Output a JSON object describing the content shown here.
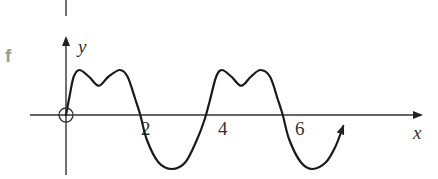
{
  "panel_label": "f",
  "chart_data": {
    "type": "line",
    "title": "",
    "xlabel": "x",
    "ylabel": "y",
    "x_ticks": [
      {
        "value": 2,
        "label": "2"
      },
      {
        "value": 4,
        "label": "4"
      },
      {
        "value": 6,
        "label": "6"
      }
    ],
    "xlim": [
      -1.6,
      7.7
    ],
    "ylim": [
      -1.4,
      1.5
    ],
    "grid": false,
    "annotations": [
      {
        "type": "open-circle",
        "x": 0,
        "y": 0,
        "meaning": "origin / excluded point"
      },
      {
        "type": "arrowhead",
        "at": "curve-end",
        "meaning": "curve continues"
      }
    ],
    "series": [
      {
        "name": "curve",
        "points": [
          [
            0,
            0
          ],
          [
            0.1,
            0.45
          ],
          [
            0.2,
            0.85
          ],
          [
            0.35,
            1.0
          ],
          [
            0.6,
            0.85
          ],
          [
            0.85,
            0.65
          ],
          [
            1.1,
            0.85
          ],
          [
            1.4,
            1.0
          ],
          [
            1.6,
            0.85
          ],
          [
            1.8,
            0.35
          ],
          [
            1.93,
            0.0
          ],
          [
            2.1,
            -0.55
          ],
          [
            2.4,
            -1.05
          ],
          [
            2.75,
            -1.2
          ],
          [
            3.1,
            -1.05
          ],
          [
            3.4,
            -0.55
          ],
          [
            3.6,
            -0.1
          ],
          [
            3.73,
            0.3
          ],
          [
            3.9,
            0.85
          ],
          [
            4.05,
            1.0
          ],
          [
            4.3,
            0.85
          ],
          [
            4.55,
            0.65
          ],
          [
            4.8,
            0.85
          ],
          [
            5.05,
            1.0
          ],
          [
            5.3,
            0.85
          ],
          [
            5.5,
            0.35
          ],
          [
            5.63,
            0.0
          ],
          [
            5.8,
            -0.55
          ],
          [
            6.1,
            -1.05
          ],
          [
            6.4,
            -1.2
          ],
          [
            6.75,
            -1.05
          ],
          [
            7.0,
            -0.7
          ],
          [
            7.2,
            -0.25
          ]
        ]
      }
    ]
  }
}
